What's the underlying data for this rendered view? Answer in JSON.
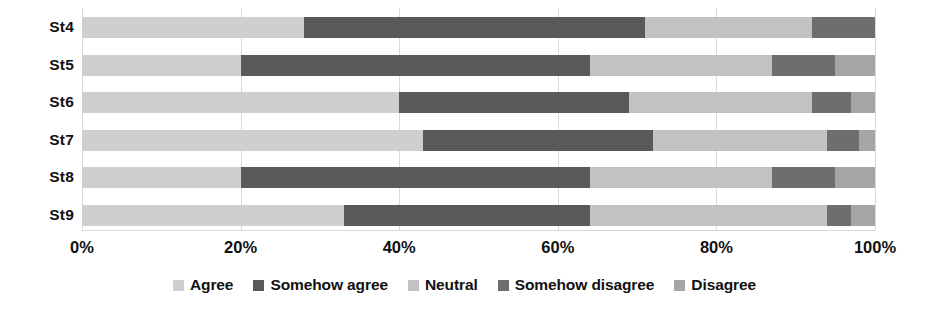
{
  "chart_data": {
    "type": "bar",
    "orientation": "horizontal",
    "stacked": true,
    "normalized_percent": true,
    "title": "",
    "xlabel": "",
    "ylabel": "",
    "xlim": [
      0,
      100
    ],
    "grid": true,
    "grid_axis": "x",
    "legend_position": "bottom",
    "categories": [
      "St4",
      "St5",
      "St6",
      "St7",
      "St8",
      "St9"
    ],
    "tick_labels": [
      "0%",
      "20%",
      "40%",
      "60%",
      "80%",
      "100%"
    ],
    "tick_values": [
      0,
      20,
      40,
      60,
      80,
      100
    ],
    "series": [
      {
        "name": "Agree",
        "color": "#cfcfcf",
        "values": [
          28,
          20,
          40,
          43,
          20,
          33
        ]
      },
      {
        "name": "Somehow agree",
        "color": "#595959",
        "values": [
          43,
          44,
          29,
          29,
          44,
          31
        ]
      },
      {
        "name": "Neutral",
        "color": "#c2c2c2",
        "values": [
          21,
          23,
          23,
          22,
          23,
          30
        ]
      },
      {
        "name": "Somehow disagree",
        "color": "#6e6e6e",
        "values": [
          8,
          8,
          5,
          4,
          8,
          3
        ]
      },
      {
        "name": "Disagree",
        "color": "#a6a6a6",
        "values": [
          0,
          5,
          3,
          2,
          5,
          3
        ]
      }
    ]
  },
  "legend": {
    "items": [
      {
        "label": "Agree",
        "color": "#cfcfcf"
      },
      {
        "label": "Somehow agree",
        "color": "#595959"
      },
      {
        "label": "Neutral",
        "color": "#c2c2c2"
      },
      {
        "label": "Somehow disagree",
        "color": "#6e6e6e"
      },
      {
        "label": "Disagree",
        "color": "#a6a6a6"
      }
    ]
  }
}
